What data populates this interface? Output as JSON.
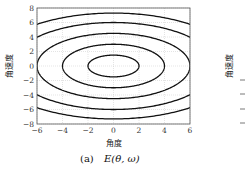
{
  "chart_data": [
    {
      "type": "contour",
      "title": "",
      "caption": "(a)  E(θ, ω)",
      "caption_label": "(a)",
      "caption_math": "E(θ, ω)",
      "xlabel": "角度",
      "ylabel": "角速度",
      "xlim": [
        -6,
        6
      ],
      "ylim": [
        -8,
        8
      ],
      "xticks": [
        -6,
        -4,
        -2,
        0,
        2,
        4,
        6
      ],
      "yticks": [
        -8,
        -6,
        -4,
        -2,
        0,
        2,
        4,
        6,
        8
      ],
      "grid": true,
      "contours": [
        {
          "level": 1,
          "theta_halfwidth": 2,
          "omega_halfheight": 1.5,
          "closed": true
        },
        {
          "level": 2,
          "theta_halfwidth": 4,
          "omega_halfheight": 3,
          "closed": true
        },
        {
          "level": 3,
          "theta_halfwidth": 6,
          "omega_halfheight": 4.5,
          "closed": true
        },
        {
          "level": 4,
          "omega_at_theta0": 6,
          "omega_at_theta6": 4,
          "closed": false
        },
        {
          "level": 5,
          "omega_at_theta0": 7.3,
          "omega_at_theta6": 5.75,
          "closed": false
        }
      ],
      "line_color": "#111111",
      "grid_color": "#c8c8c8"
    },
    {
      "type": "contour",
      "partial": true,
      "ylabel": "角速度"
    }
  ]
}
